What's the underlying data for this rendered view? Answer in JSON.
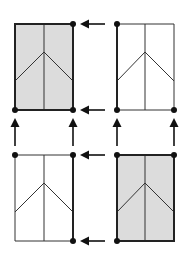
{
  "diagram": {
    "colors": {
      "shaded_fill": "#dcdcdc",
      "plain_fill": "#ffffff",
      "line": "#222222",
      "dot": "#111111"
    },
    "panels": [
      {
        "id": "top-left",
        "shaded": true
      },
      {
        "id": "top-right",
        "shaded": false
      },
      {
        "id": "bottom-left",
        "shaded": false
      },
      {
        "id": "bottom-right",
        "shaded": true
      }
    ],
    "arrows": [
      {
        "direction": "left",
        "from": "top-right",
        "to": "top-left",
        "row": "top"
      },
      {
        "direction": "left",
        "from": "top-right",
        "to": "top-left",
        "row": "bottom"
      },
      {
        "direction": "left",
        "from": "bottom-right",
        "to": "bottom-left",
        "row": "top"
      },
      {
        "direction": "left",
        "from": "bottom-right",
        "to": "bottom-left",
        "row": "bottom"
      },
      {
        "direction": "up",
        "from": "bottom-left",
        "to": "top-left",
        "column": "left"
      },
      {
        "direction": "up",
        "from": "bottom-left",
        "to": "top-left",
        "column": "right"
      },
      {
        "direction": "up",
        "from": "bottom-right",
        "to": "top-right",
        "column": "left"
      },
      {
        "direction": "up",
        "from": "bottom-right",
        "to": "top-right",
        "column": "right"
      }
    ]
  }
}
